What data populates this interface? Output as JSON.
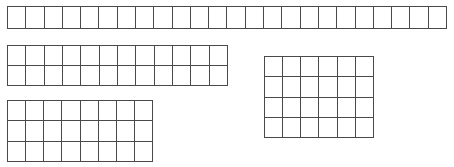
{
  "diagram": {
    "type": "unit-square-grid-collection",
    "background_color": "#ffffff",
    "line_color": "#4a4a4a",
    "cell_fill_color": "#ffffff",
    "line_width_px": 1.5,
    "unit_cell": {
      "width_px": 18.3,
      "height_px": 20.5
    },
    "grid_count": 4,
    "total_unit_squares": 92,
    "grids": [
      {
        "id": "strip-top",
        "name": "top-strip-grid",
        "label": "",
        "columns": 24,
        "rows": 1,
        "cell_count": 24,
        "x_px": 7,
        "y_px": 6,
        "width_px": 440,
        "height_px": 23
      },
      {
        "id": "rect-middle-left",
        "name": "middle-left-grid",
        "label": "",
        "columns": 12,
        "rows": 2,
        "cell_count": 24,
        "x_px": 7,
        "y_px": 45,
        "width_px": 221,
        "height_px": 41
      },
      {
        "id": "rect-bottom-left",
        "name": "bottom-left-grid",
        "label": "",
        "columns": 8,
        "rows": 3,
        "cell_count": 24,
        "x_px": 7,
        "y_px": 100,
        "width_px": 146,
        "height_px": 62
      },
      {
        "id": "rect-right",
        "name": "right-grid",
        "label": "",
        "columns": 6,
        "rows": 4,
        "cell_count": 24,
        "x_px": 264,
        "y_px": 56,
        "width_px": 110,
        "height_px": 82
      }
    ]
  }
}
